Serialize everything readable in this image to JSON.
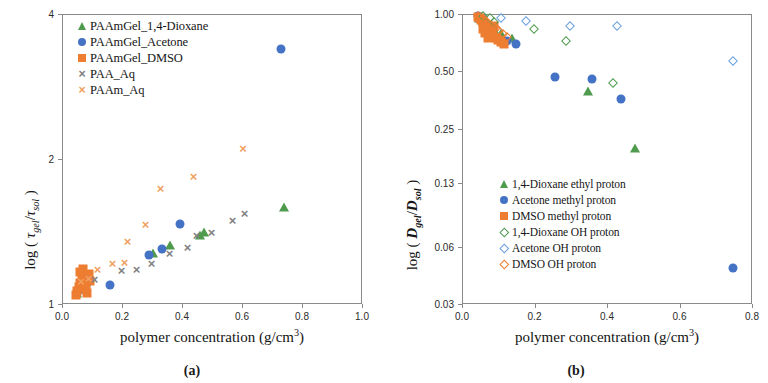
{
  "figure": {
    "caption_a": "(a)",
    "caption_b": "(b)"
  },
  "colors": {
    "green": "#4e9b4e",
    "blue": "#4472c4",
    "orange": "#ed7d31",
    "gray": "#808080",
    "axis": "#8a8a8a"
  },
  "chart_data": [
    {
      "type": "scatter",
      "panel": "a",
      "title": "",
      "xlabel": "polymer concentration (g/cm3)",
      "ylabel": "log ( τgel/τsol )",
      "xlim": [
        0.0,
        1.0
      ],
      "ylim": [
        1,
        4
      ],
      "yscale": "log",
      "grid": false,
      "xticks": [
        "0.0",
        "0.2",
        "0.4",
        "0.6",
        "0.8",
        "1.0"
      ],
      "xtick_values": [
        0.0,
        0.2,
        0.4,
        0.6,
        0.8,
        1.0
      ],
      "yticks": [
        "4",
        "2",
        "1"
      ],
      "ytick_values": [
        4,
        2,
        1
      ],
      "legend_position": "upper-left",
      "series": [
        {
          "name": "PAAmGel_1,4-Dioxane",
          "marker": "triangle",
          "fill": "solid",
          "color": "#4e9b4e",
          "points": [
            [
              0.045,
              1.06
            ],
            [
              0.055,
              1.08
            ],
            [
              0.065,
              1.09
            ],
            [
              0.075,
              1.12
            ],
            [
              0.3,
              1.28
            ],
            [
              0.355,
              1.33
            ],
            [
              0.455,
              1.4
            ],
            [
              0.47,
              1.42
            ],
            [
              0.735,
              1.6
            ]
          ]
        },
        {
          "name": "PAAmGel_Acetone",
          "marker": "circle",
          "fill": "solid",
          "color": "#4472c4",
          "points": [
            [
              0.05,
              1.07
            ],
            [
              0.06,
              1.09
            ],
            [
              0.075,
              1.1
            ],
            [
              0.155,
              1.1
            ],
            [
              0.285,
              1.27
            ],
            [
              0.33,
              1.31
            ],
            [
              0.39,
              1.47
            ],
            [
              0.725,
              3.4
            ]
          ]
        },
        {
          "name": "PAAmGel_DMSO",
          "marker": "square",
          "fill": "solid",
          "color": "#ed7d31",
          "points": [
            [
              0.042,
              1.05
            ],
            [
              0.048,
              1.07
            ],
            [
              0.052,
              1.09
            ],
            [
              0.058,
              1.11
            ],
            [
              0.062,
              1.13
            ],
            [
              0.066,
              1.15
            ],
            [
              0.07,
              1.12
            ],
            [
              0.074,
              1.1
            ],
            [
              0.078,
              1.08
            ],
            [
              0.082,
              1.14
            ],
            [
              0.086,
              1.16
            ],
            [
              0.09,
              1.12
            ],
            [
              0.055,
              1.17
            ],
            [
              0.068,
              1.19
            ],
            [
              0.08,
              1.06
            ]
          ]
        },
        {
          "name": "PAA_Aq",
          "marker": "x",
          "fill": "none",
          "color": "#808080",
          "points": [
            [
              0.105,
              1.13
            ],
            [
              0.195,
              1.18
            ],
            [
              0.245,
              1.19
            ],
            [
              0.295,
              1.22
            ],
            [
              0.355,
              1.28
            ],
            [
              0.415,
              1.32
            ],
            [
              0.445,
              1.4
            ],
            [
              0.495,
              1.42
            ],
            [
              0.565,
              1.5
            ],
            [
              0.605,
              1.55
            ]
          ]
        },
        {
          "name": "PAAm_Aq",
          "marker": "x",
          "fill": "none",
          "color": "#f0a060",
          "points": [
            [
              0.06,
              1.12
            ],
            [
              0.085,
              1.14
            ],
            [
              0.115,
              1.19
            ],
            [
              0.165,
              1.22
            ],
            [
              0.205,
              1.23
            ],
            [
              0.215,
              1.36
            ],
            [
              0.275,
              1.47
            ],
            [
              0.325,
              1.75
            ],
            [
              0.435,
              1.85
            ],
            [
              0.6,
              2.12
            ]
          ]
        }
      ]
    },
    {
      "type": "scatter",
      "panel": "b",
      "title": "",
      "xlabel": "polymer concentration (g/cm3)",
      "ylabel": "log ( Dgel/Dsol )",
      "xlim": [
        0.0,
        0.8
      ],
      "ylim": [
        0.03,
        1.0
      ],
      "yscale": "log",
      "grid": false,
      "xticks": [
        "0.0",
        "0.2",
        "0.4",
        "0.6",
        "0.8"
      ],
      "xtick_values": [
        0.0,
        0.2,
        0.4,
        0.6,
        0.8
      ],
      "yticks": [
        "1.00",
        "0.50",
        "0.25",
        "0.13",
        "0.06",
        "0.03"
      ],
      "ytick_values": [
        1.0,
        0.5,
        0.25,
        0.13,
        0.06,
        0.03
      ],
      "legend_position": "lower-left",
      "series": [
        {
          "name": "1,4-Dioxane ethyl proton",
          "marker": "triangle",
          "fill": "solid",
          "color": "#4e9b4e",
          "points": [
            [
              0.045,
              0.96
            ],
            [
              0.055,
              0.93
            ],
            [
              0.065,
              0.9
            ],
            [
              0.075,
              0.88
            ],
            [
              0.085,
              0.84
            ],
            [
              0.105,
              0.8
            ],
            [
              0.135,
              0.76
            ],
            [
              0.345,
              0.4
            ],
            [
              0.475,
              0.2
            ]
          ]
        },
        {
          "name": "Acetone methyl proton",
          "marker": "circle",
          "fill": "solid",
          "color": "#4472c4",
          "points": [
            [
              0.042,
              0.99
            ],
            [
              0.048,
              0.97
            ],
            [
              0.055,
              0.95
            ],
            [
              0.12,
              0.73
            ],
            [
              0.145,
              0.7
            ],
            [
              0.255,
              0.47
            ],
            [
              0.355,
              0.46
            ],
            [
              0.435,
              0.36
            ],
            [
              0.745,
              0.047
            ]
          ]
        },
        {
          "name": "DMSO methyl proton",
          "marker": "square",
          "fill": "solid",
          "color": "#ed7d31",
          "points": [
            [
              0.04,
              0.98
            ],
            [
              0.046,
              0.96
            ],
            [
              0.05,
              0.94
            ],
            [
              0.054,
              0.92
            ],
            [
              0.058,
              0.9
            ],
            [
              0.062,
              0.88
            ],
            [
              0.066,
              0.86
            ],
            [
              0.07,
              0.84
            ],
            [
              0.074,
              0.82
            ],
            [
              0.078,
              0.8
            ],
            [
              0.084,
              0.78
            ],
            [
              0.09,
              0.76
            ],
            [
              0.096,
              0.74
            ],
            [
              0.104,
              0.72
            ],
            [
              0.112,
              0.7
            ],
            [
              0.062,
              0.8
            ],
            [
              0.07,
              0.76
            ],
            [
              0.078,
              0.86
            ],
            [
              0.086,
              0.88
            ],
            [
              0.056,
              0.84
            ]
          ]
        },
        {
          "name": "1,4-Dioxane OH proton",
          "marker": "diamond",
          "fill": "open",
          "color": "#4e9b4e",
          "points": [
            [
              0.055,
              0.99
            ],
            [
              0.075,
              0.96
            ],
            [
              0.085,
              0.92
            ],
            [
              0.195,
              0.84
            ],
            [
              0.285,
              0.73
            ],
            [
              0.415,
              0.44
            ]
          ]
        },
        {
          "name": "Acetone OH proton",
          "marker": "diamond",
          "fill": "open",
          "color": "#6a9fe0",
          "points": [
            [
              0.105,
              0.97
            ],
            [
              0.175,
              0.93
            ],
            [
              0.295,
              0.88
            ],
            [
              0.425,
              0.88
            ],
            [
              0.745,
              0.57
            ]
          ]
        },
        {
          "name": "DMSO OH proton",
          "marker": "diamond",
          "fill": "open",
          "color": "#ed7d31",
          "points": [
            [
              0.04,
              0.99
            ],
            [
              0.048,
              0.97
            ],
            [
              0.056,
              0.95
            ],
            [
              0.064,
              0.93
            ],
            [
              0.072,
              0.9
            ],
            [
              0.08,
              0.88
            ],
            [
              0.09,
              0.85
            ],
            [
              0.1,
              0.82
            ],
            [
              0.11,
              0.79
            ],
            [
              0.12,
              0.77
            ]
          ]
        }
      ]
    }
  ],
  "panel_a": {
    "legend": [
      {
        "label": "PAAmGel_1,4-Dioxane",
        "marker": "triangle",
        "fill": "solid",
        "color": "#4e9b4e"
      },
      {
        "label": "PAAmGel_Acetone",
        "marker": "circle",
        "fill": "solid",
        "color": "#4472c4"
      },
      {
        "label": "PAAmGel_DMSO",
        "marker": "square",
        "fill": "solid",
        "color": "#ed7d31"
      },
      {
        "label": "PAA_Aq",
        "marker": "x",
        "fill": "none",
        "color": "#808080"
      },
      {
        "label": "PAAm_Aq",
        "marker": "x",
        "fill": "none",
        "color": "#f0a060"
      }
    ],
    "xticks": [
      "0.0",
      "0.2",
      "0.4",
      "0.6",
      "0.8",
      "1.0"
    ],
    "yticks": [
      "4",
      "2",
      "1"
    ]
  },
  "panel_b": {
    "legend": [
      {
        "label": "1,4-Dioxane ethyl proton",
        "marker": "triangle",
        "fill": "solid",
        "color": "#4e9b4e"
      },
      {
        "label": "Acetone methyl proton",
        "marker": "circle",
        "fill": "solid",
        "color": "#4472c4"
      },
      {
        "label": "DMSO methyl proton",
        "marker": "square",
        "fill": "solid",
        "color": "#ed7d31"
      },
      {
        "label": "1,4-Dioxane OH proton",
        "marker": "diamond",
        "fill": "open",
        "color": "#4e9b4e"
      },
      {
        "label": "Acetone OH proton",
        "marker": "diamond",
        "fill": "open",
        "color": "#6a9fe0"
      },
      {
        "label": "DMSO OH proton",
        "marker": "diamond",
        "fill": "open",
        "color": "#ed7d31"
      }
    ],
    "xticks": [
      "0.0",
      "0.2",
      "0.4",
      "0.6",
      "0.8"
    ],
    "yticks": [
      "1.00",
      "0.50",
      "0.25",
      "0.13",
      "0.06",
      "0.03"
    ]
  }
}
